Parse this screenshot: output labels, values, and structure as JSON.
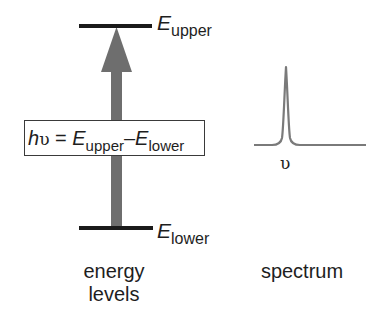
{
  "diagram": {
    "energy_levels": {
      "upper": {
        "symbol": "E",
        "subscript": "upper"
      },
      "lower": {
        "symbol": "E",
        "subscript": "lower"
      },
      "caption_line1": "energy",
      "caption_line2": "levels"
    },
    "transition_arrow": {
      "direction": "up",
      "color": "#6e6e6e"
    },
    "equation": {
      "h": "h",
      "nu": "υ",
      "equals": " = ",
      "E1": "E",
      "sub1": "upper",
      "minus": "–",
      "E2": "E",
      "sub2": "lower"
    },
    "spectrum": {
      "peak_label": "υ",
      "caption": "spectrum",
      "line_color": "#7a7a7a"
    },
    "level_line_color": "#1a1a1a"
  }
}
